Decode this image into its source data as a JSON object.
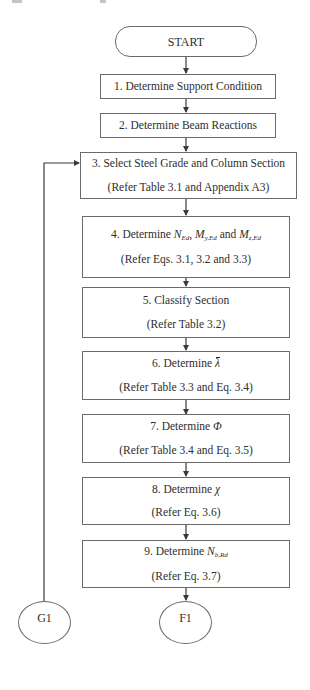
{
  "diagram": {
    "type": "flowchart",
    "start": {
      "label": "START"
    },
    "steps": [
      {
        "id": 1,
        "title": "1. Determine Support Condition",
        "ref": ""
      },
      {
        "id": 2,
        "title": "2. Determine Beam Reactions",
        "ref": ""
      },
      {
        "id": 3,
        "title": "3. Select Steel Grade and Column Section",
        "ref": "(Refer Table 3.1 and Appendix A3)"
      },
      {
        "id": 4,
        "title_prefix": "4. Determine ",
        "sym1": "N",
        "sym1_sub": "Ed",
        "sep1": ", ",
        "sym2": "M",
        "sym2_sub": "y,Ed",
        "sep2": " and ",
        "sym3": "M",
        "sym3_sub": "z,Ed",
        "ref": "(Refer Eqs. 3.1, 3.2 and 3.3)"
      },
      {
        "id": 5,
        "title": "5. Classify Section",
        "ref": "(Refer Table 3.2)"
      },
      {
        "id": 6,
        "title_prefix": "6. Determine ",
        "symbol": "λ",
        "ref": "(Refer Table 3.3 and Eq. 3.4)"
      },
      {
        "id": 7,
        "title_prefix": "7. Determine ",
        "symbol": "Φ",
        "ref": "(Refer Table 3.4 and Eq. 3.5)"
      },
      {
        "id": 8,
        "title_prefix": "8. Determine ",
        "symbol": "χ",
        "ref": "(Refer Eq. 3.6)"
      },
      {
        "id": 9,
        "title_prefix": "9. Determine ",
        "symbol": "N",
        "symbol_sub": "b,Rd",
        "ref": "(Refer Eq. 3.7)"
      }
    ],
    "connectors": {
      "loop_back": {
        "label": "G1",
        "target_step": 3
      },
      "continue": {
        "label": "F1"
      }
    },
    "colors": {
      "stroke": "#6a6a6a",
      "text": "#2e2e2e",
      "background": "#ffffff"
    }
  }
}
